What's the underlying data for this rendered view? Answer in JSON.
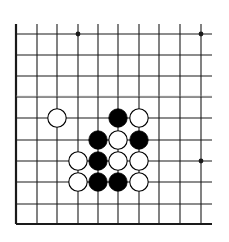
{
  "diagram": {
    "type": "go-board-fragment",
    "colors": {
      "background": "#ffffff",
      "line": "#1a1a1a",
      "black_stone": "#000000",
      "white_stone": "#ffffff"
    },
    "grid": {
      "columns_x": [
        16,
        37,
        57,
        78,
        98,
        118,
        139,
        159,
        180,
        201
      ],
      "rows_y": [
        34,
        55,
        76,
        97,
        118,
        140,
        161,
        182,
        204,
        224
      ],
      "right_extent_x": 212,
      "top_extent_y": 24,
      "thick_edges": [
        "left",
        "bottom"
      ]
    },
    "star_points": [
      {
        "col": 3,
        "row": 0
      },
      {
        "col": 9,
        "row": 0
      },
      {
        "col": 9,
        "row": 6
      }
    ],
    "stones": [
      {
        "color": "white",
        "col": 2,
        "row": 4
      },
      {
        "color": "black",
        "col": 5,
        "row": 4
      },
      {
        "color": "white",
        "col": 6,
        "row": 4
      },
      {
        "color": "black",
        "col": 4,
        "row": 5
      },
      {
        "color": "white",
        "col": 5,
        "row": 5
      },
      {
        "color": "black",
        "col": 6,
        "row": 5
      },
      {
        "color": "white",
        "col": 3,
        "row": 6
      },
      {
        "color": "black",
        "col": 4,
        "row": 6
      },
      {
        "color": "white",
        "col": 5,
        "row": 6
      },
      {
        "color": "white",
        "col": 6,
        "row": 6
      },
      {
        "color": "white",
        "col": 3,
        "row": 7
      },
      {
        "color": "black",
        "col": 4,
        "row": 7
      },
      {
        "color": "black",
        "col": 5,
        "row": 7
      },
      {
        "color": "white",
        "col": 6,
        "row": 7
      }
    ]
  }
}
